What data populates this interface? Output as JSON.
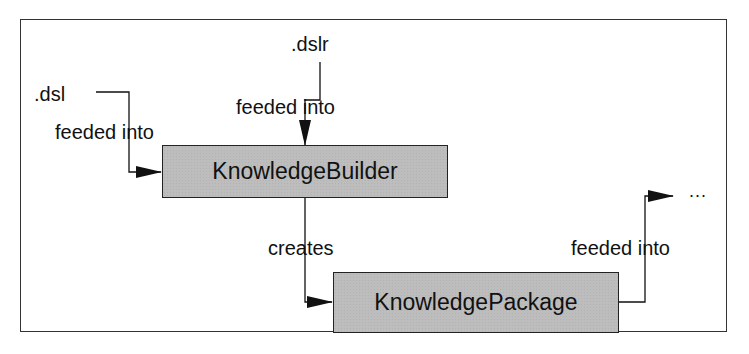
{
  "diagram": {
    "nodes": [
      {
        "id": "knowledge-builder",
        "label": "KnowledgeBuilder"
      },
      {
        "id": "knowledge-package",
        "label": "KnowledgePackage"
      }
    ],
    "sources": {
      "dsl": ".dsl",
      "dslr": ".dslr",
      "ellipsis": "..."
    },
    "edges": [
      {
        "from": ".dsl",
        "to": "KnowledgeBuilder",
        "label": "feeded into"
      },
      {
        "from": ".dslr",
        "to": "KnowledgeBuilder",
        "label": "feeded into"
      },
      {
        "from": "KnowledgeBuilder",
        "to": "KnowledgePackage",
        "label": "creates"
      },
      {
        "from": "KnowledgePackage",
        "to": "...",
        "label": "feeded into"
      }
    ]
  }
}
